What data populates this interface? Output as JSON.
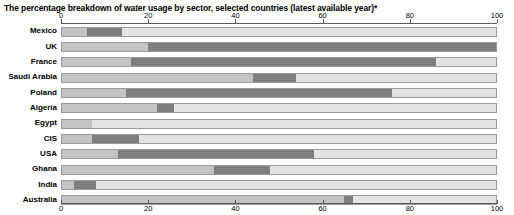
{
  "title": "The percentage breakdown of water usage by sector, selected countries (latest available year)*",
  "axis": {
    "ticks": [
      {
        "label": "0",
        "value": 0
      },
      {
        "label": "20",
        "value": 20
      },
      {
        "label": "40",
        "value": 40
      },
      {
        "label": "60",
        "value": 60
      },
      {
        "label": "80",
        "value": 80
      },
      {
        "label": "100",
        "value": 100
      }
    ]
  },
  "colors": {
    "segment_light": "#e3e3e3",
    "segment_medium": "#c3c3c3",
    "segment_dark": "#7e7e7e",
    "axis": "#5a5a5a",
    "outline": "#9a9a9a",
    "background": "#ffffff",
    "text": "#000000"
  },
  "chart_data": {
    "type": "bar",
    "orientation": "horizontal",
    "stacked": true,
    "title": "The percentage breakdown of water usage by sector, selected countries (latest available year)*",
    "xlabel": "",
    "ylabel": "",
    "xlim": [
      0,
      100
    ],
    "grid": true,
    "legend": "none",
    "categories": [
      "Mexico",
      "UK",
      "France",
      "Saudi Arabia",
      "Poland",
      "Algeria",
      "Egypt",
      "CIS",
      "USA",
      "Ghana",
      "India",
      "Australia"
    ],
    "series": [
      {
        "name": "Domestic",
        "color": "#c3c3c3",
        "values": [
          6,
          20,
          16,
          0,
          15,
          25,
          7,
          5,
          13,
          35,
          3,
          65
        ]
      },
      {
        "name": "Industrial",
        "color": "#7e7e7e",
        "values": [
          8,
          80,
          70,
          0,
          61,
          0,
          0,
          30,
          45,
          13,
          5,
          2
        ]
      },
      {
        "name": "Agricultural",
        "color": "#e3e3e3",
        "values": [
          86,
          0,
          14,
          100,
          24,
          75,
          93,
          65,
          42,
          52,
          92,
          33
        ]
      }
    ],
    "rows": [
      {
        "country": "Mexico",
        "segments": [
          {
            "sector": "Domestic",
            "start": 0,
            "end": 6,
            "shade": "medium"
          },
          {
            "sector": "Industrial",
            "start": 6,
            "end": 14,
            "shade": "dark"
          },
          {
            "sector": "Agricultural",
            "start": 14,
            "end": 100,
            "shade": "light"
          }
        ]
      },
      {
        "country": "UK",
        "segments": [
          {
            "sector": "Domestic",
            "start": 0,
            "end": 20,
            "shade": "medium"
          },
          {
            "sector": "Industrial",
            "start": 20,
            "end": 100,
            "shade": "dark"
          }
        ]
      },
      {
        "country": "France",
        "segments": [
          {
            "sector": "Domestic",
            "start": 0,
            "end": 16,
            "shade": "medium"
          },
          {
            "sector": "Industrial",
            "start": 16,
            "end": 86,
            "shade": "dark"
          },
          {
            "sector": "Agricultural",
            "start": 86,
            "end": 100,
            "shade": "light"
          }
        ]
      },
      {
        "country": "Saudi Arabia",
        "segments": [
          {
            "sector": "Domestic",
            "start": 0,
            "end": 44,
            "shade": "medium"
          },
          {
            "sector": "Industrial",
            "start": 44,
            "end": 54,
            "shade": "dark"
          },
          {
            "sector": "Agricultural",
            "start": 54,
            "end": 100,
            "shade": "light"
          }
        ]
      },
      {
        "country": "Poland",
        "segments": [
          {
            "sector": "Domestic",
            "start": 0,
            "end": 15,
            "shade": "medium"
          },
          {
            "sector": "Industrial",
            "start": 15,
            "end": 76,
            "shade": "dark"
          },
          {
            "sector": "Agricultural",
            "start": 76,
            "end": 100,
            "shade": "light"
          }
        ]
      },
      {
        "country": "Algeria",
        "segments": [
          {
            "sector": "Domestic",
            "start": 0,
            "end": 22,
            "shade": "medium"
          },
          {
            "sector": "Industrial",
            "start": 22,
            "end": 26,
            "shade": "dark"
          },
          {
            "sector": "Agricultural",
            "start": 26,
            "end": 100,
            "shade": "light"
          }
        ]
      },
      {
        "country": "Egypt",
        "segments": [
          {
            "sector": "Domestic",
            "start": 0,
            "end": 7,
            "shade": "medium"
          },
          {
            "sector": "Agricultural",
            "start": 7,
            "end": 100,
            "shade": "light"
          }
        ]
      },
      {
        "country": "CIS",
        "segments": [
          {
            "sector": "Domestic",
            "start": 0,
            "end": 7,
            "shade": "medium"
          },
          {
            "sector": "Industrial",
            "start": 7,
            "end": 18,
            "shade": "dark"
          },
          {
            "sector": "Agricultural",
            "start": 18,
            "end": 100,
            "shade": "light"
          }
        ]
      },
      {
        "country": "USA",
        "segments": [
          {
            "sector": "Domestic",
            "start": 0,
            "end": 13,
            "shade": "medium"
          },
          {
            "sector": "Industrial",
            "start": 13,
            "end": 58,
            "shade": "dark"
          },
          {
            "sector": "Agricultural",
            "start": 58,
            "end": 100,
            "shade": "light"
          }
        ]
      },
      {
        "country": "Ghana",
        "segments": [
          {
            "sector": "Domestic",
            "start": 0,
            "end": 35,
            "shade": "medium"
          },
          {
            "sector": "Industrial",
            "start": 35,
            "end": 48,
            "shade": "dark"
          },
          {
            "sector": "Agricultural",
            "start": 48,
            "end": 100,
            "shade": "light"
          }
        ]
      },
      {
        "country": "India",
        "segments": [
          {
            "sector": "Domestic",
            "start": 0,
            "end": 3,
            "shade": "medium"
          },
          {
            "sector": "Industrial",
            "start": 3,
            "end": 8,
            "shade": "dark"
          },
          {
            "sector": "Agricultural",
            "start": 8,
            "end": 100,
            "shade": "light"
          }
        ]
      },
      {
        "country": "Australia",
        "segments": [
          {
            "sector": "Domestic",
            "start": 0,
            "end": 65,
            "shade": "medium"
          },
          {
            "sector": "Industrial",
            "start": 65,
            "end": 67,
            "shade": "dark"
          },
          {
            "sector": "Agricultural",
            "start": 67,
            "end": 100,
            "shade": "light"
          }
        ]
      }
    ]
  }
}
